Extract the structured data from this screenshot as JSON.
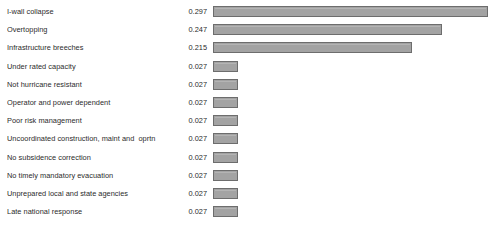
{
  "chart_data": {
    "type": "bar",
    "orientation": "horizontal",
    "title": "",
    "subtitle": "",
    "xlabel": "",
    "ylabel": "",
    "grid": false,
    "legend": false,
    "axis_visible": false,
    "value_labels_shown": true,
    "xlim": [
      0,
      0.3
    ],
    "bar_color": "#a3a3a3",
    "bar_border_color": "#6d6d6d",
    "background_color": "#ffffff",
    "text_color": "#2b2b2b",
    "categories": [
      "I-wall collapse",
      "Overtopping",
      "Infrastructure breeches",
      "Under rated capacity",
      "Not hurricane resistant",
      "Operator and power dependent",
      "Poor risk management",
      "Uncoordinated construction, maint and  oprtn",
      "No subsidence correction",
      "No timely mandatory evacuation",
      "Unprepared local and state agencies",
      "Late national response"
    ],
    "values": [
      0.297,
      0.247,
      0.215,
      0.027,
      0.027,
      0.027,
      0.027,
      0.027,
      0.027,
      0.027,
      0.027,
      0.027
    ],
    "value_labels": [
      "0.297",
      "0.247",
      "0.215",
      "0.027",
      "0.027",
      "0.027",
      "0.027",
      "0.027",
      "0.027",
      "0.027",
      "0.027",
      "0.027"
    ]
  }
}
